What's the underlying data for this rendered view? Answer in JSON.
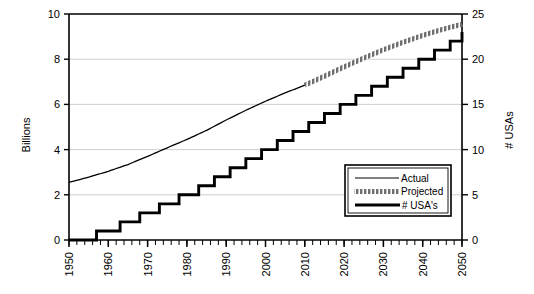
{
  "chart_data": {
    "type": "line",
    "title": "",
    "xlabel": "",
    "ylabel": "Billions",
    "y2label": "# USAs",
    "xlim": [
      1950,
      2050
    ],
    "ylim": [
      0,
      10
    ],
    "y2lim": [
      0,
      25
    ],
    "grid": true,
    "legend_position": "inside-right",
    "x_ticks": [
      "1950",
      "1960",
      "1970",
      "1980",
      "1990",
      "2000",
      "2010",
      "2020",
      "2030",
      "2040",
      "2050"
    ],
    "y_ticks": [
      "0",
      "2",
      "4",
      "6",
      "8",
      "10"
    ],
    "y2_ticks": [
      "0",
      "5",
      "10",
      "15",
      "20",
      "25"
    ],
    "legend": [
      {
        "label": "Actual",
        "style": "thin-line",
        "color": "#000000"
      },
      {
        "label": "Projected",
        "style": "hatched-thick-line",
        "color": "#808080"
      },
      {
        "label": "# USA's",
        "style": "thick-line",
        "color": "#000000"
      }
    ],
    "series": [
      {
        "name": "Actual",
        "axis": "left",
        "units": "Billions",
        "x": [
          1950,
          1955,
          1960,
          1965,
          1970,
          1975,
          1980,
          1985,
          1990,
          1995,
          2000,
          2005,
          2010
        ],
        "values": [
          2.55,
          2.78,
          3.04,
          3.34,
          3.7,
          4.08,
          4.45,
          4.85,
          5.31,
          5.74,
          6.14,
          6.51,
          6.85
        ]
      },
      {
        "name": "Projected",
        "axis": "left",
        "units": "Billions",
        "x": [
          2010,
          2015,
          2020,
          2025,
          2030,
          2035,
          2040,
          2045,
          2050
        ],
        "values": [
          6.85,
          7.25,
          7.66,
          8.05,
          8.42,
          8.75,
          9.05,
          9.32,
          9.55
        ]
      },
      {
        "name": "# USA's",
        "axis": "right",
        "units": "# USAs",
        "step": true,
        "x": [
          1950,
          1956,
          1957,
          1962,
          1963,
          1967,
          1968,
          1972,
          1973,
          1977,
          1978,
          1982,
          1983,
          1986,
          1987,
          1990,
          1991,
          1994,
          1995,
          1998,
          1999,
          2002,
          2003,
          2006,
          2007,
          2010,
          2011,
          2014,
          2015,
          2018,
          2019,
          2022,
          2023,
          2026,
          2027,
          2030,
          2031,
          2034,
          2035,
          2038,
          2039,
          2042,
          2043,
          2046,
          2047,
          2050
        ],
        "values": [
          0,
          0,
          1,
          1,
          2,
          2,
          3,
          3,
          4,
          4,
          5,
          5,
          6,
          6,
          7,
          7,
          8,
          8,
          9,
          9,
          10,
          10,
          11,
          11,
          12,
          12,
          13,
          13,
          14,
          14,
          15,
          15,
          16,
          16,
          17,
          17,
          18,
          18,
          19,
          19,
          20,
          20,
          21,
          21,
          22,
          23
        ]
      }
    ]
  }
}
